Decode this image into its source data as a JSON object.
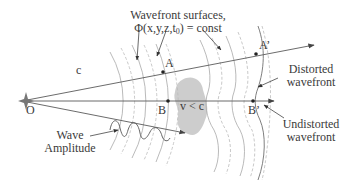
{
  "diagram": {
    "title_line1": "Wavefront surfaces,",
    "title_line2_prefix": "Φ(x,y,z,t",
    "title_line2_sub": "0",
    "title_line2_suffix": ") = const",
    "speed_label": "c",
    "medium_label": "v < c",
    "source_label": "O",
    "point_a": "A",
    "point_a_prime": "A’",
    "point_b": "B",
    "point_b_prime": "B’",
    "distorted_line1": "Distorted",
    "distorted_line2": "wavefront",
    "undistorted_line1": "Undistorted",
    "undistorted_line2": "wavefront",
    "amplitude_line1": "Wave",
    "amplitude_line2": "Amplitude"
  },
  "colors": {
    "line": "#555555",
    "arc_solid": "#9a9a9a",
    "arc_dashed": "#b5b5b5",
    "blob": "#c8c8c8",
    "text": "#3a3a3a"
  }
}
